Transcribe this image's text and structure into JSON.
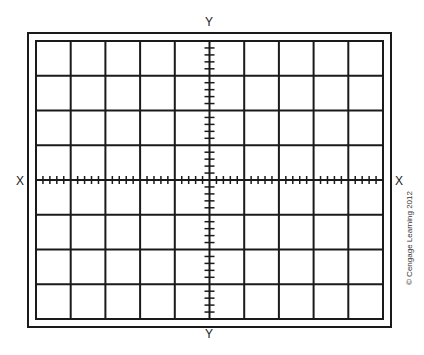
{
  "diagram": {
    "axis_labels": {
      "top": "Y",
      "bottom": "Y",
      "left": "X",
      "right": "X"
    },
    "grid": {
      "columns": 10,
      "rows": 8,
      "minor_ticks_per_division": 5
    },
    "copyright": "© Cengage Learning 2012",
    "colors": {
      "line": "#1a1a1a",
      "background": "#ffffff"
    }
  }
}
